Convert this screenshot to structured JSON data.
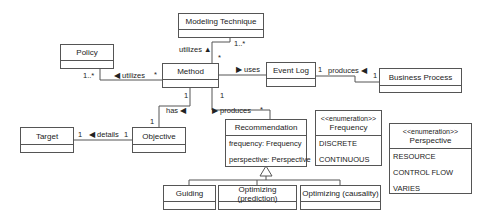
{
  "classes": {
    "modeling_technique": {
      "name": "Modeling Technique"
    },
    "policy": {
      "name": "Policy"
    },
    "method": {
      "name": "Method"
    },
    "event_log": {
      "name": "Event Log"
    },
    "business_process": {
      "name": "Business Process"
    },
    "target": {
      "name": "Target"
    },
    "objective": {
      "name": "Objective"
    },
    "recommendation": {
      "name": "Recommendation",
      "attributes": [
        "frequency: Frequency",
        "perspective: Perspective"
      ]
    },
    "guiding": {
      "name": "Guiding"
    },
    "optimizing_prediction": {
      "name": "Optimizing (prediction)"
    },
    "optimizing_causality": {
      "name": "Optimizing (causality)"
    }
  },
  "enumerations": {
    "frequency": {
      "stereotype": "<<enumeration>>",
      "name": "Frequency",
      "literals": [
        "DISCRETE",
        "CONTINUOUS"
      ]
    },
    "perspective": {
      "stereotype": "<<enumeration>>",
      "name": "Perspective",
      "literals": [
        "RESOURCE",
        "CONTROL FLOW",
        "VARIES"
      ]
    }
  },
  "associations": {
    "method_modeling": {
      "label": "utilizes ▲",
      "mult_source": "*",
      "mult_target": "1..*"
    },
    "method_policy": {
      "label": "◀ utilizes",
      "mult_source": "*",
      "mult_target": "1..*"
    },
    "method_eventlog": {
      "label": "▶ uses"
    },
    "eventlog_bp": {
      "label": "produces ◀",
      "mult_source": "1",
      "mult_target": "1"
    },
    "method_objective": {
      "label": "has ◀",
      "mult_source": "1",
      "mult_target": "1"
    },
    "method_recommendation": {
      "label": "▶ produces",
      "mult_source": "1",
      "mult_target": "*"
    },
    "objective_target": {
      "label": "◀ details",
      "mult_source": "1",
      "mult_target": "1"
    }
  }
}
